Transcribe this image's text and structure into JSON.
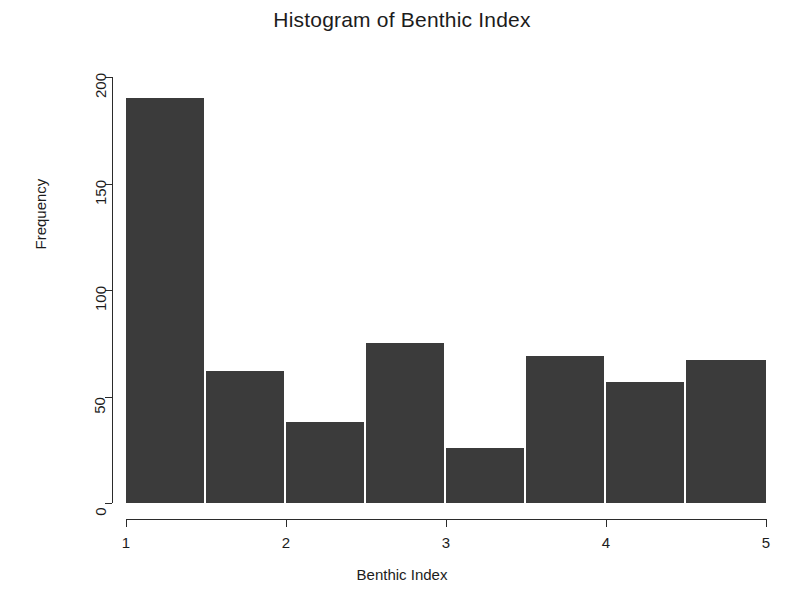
{
  "chart_data": {
    "type": "bar",
    "title": "Histogram of Benthic Index",
    "xlabel": "Benthic Index",
    "ylabel": "Frequency",
    "xlim": [
      1,
      5
    ],
    "ylim": [
      0,
      200
    ],
    "grid": false,
    "legend": false,
    "bin_width": 0.5,
    "bin_edges": [
      1,
      1.5,
      2,
      2.5,
      3,
      3.5,
      4,
      4.5,
      5
    ],
    "categories": [
      "1-1.5",
      "1.5-2",
      "2-2.5",
      "2.5-3",
      "3-3.5",
      "3.5-4",
      "4-4.5",
      "4.5-5"
    ],
    "values": [
      190,
      62,
      38,
      75,
      26,
      69,
      57,
      67
    ],
    "x_ticks": [
      1,
      2,
      3,
      4,
      5
    ],
    "x_tick_labels": [
      "1",
      "2",
      "3",
      "4",
      "5"
    ],
    "y_ticks": [
      0,
      50,
      100,
      150,
      200
    ],
    "y_tick_labels": [
      "0",
      "50",
      "100",
      "150",
      "200"
    ],
    "bar_color": "#3b3b3b",
    "axis_color": "#2b2b2b",
    "background_color": "#ffffff"
  }
}
